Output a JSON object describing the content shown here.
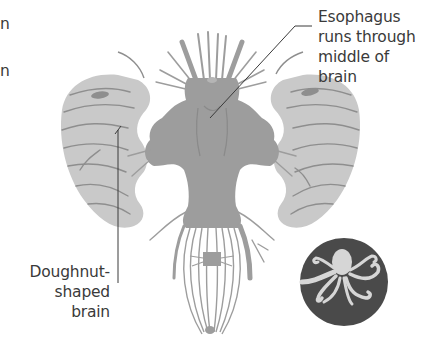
{
  "diagram": {
    "labels": {
      "esophagus": {
        "lines": [
          "Esophagus",
          "runs through",
          "middle of",
          "brain"
        ]
      },
      "doughnut": {
        "lines": [
          "Doughnut-",
          "shaped",
          "brain"
        ]
      }
    },
    "cut_off_text": {
      "line1": "n",
      "line2": "n"
    },
    "icon": "octopus-icon",
    "colors": {
      "brain_lobes": "#c9c9c9",
      "central_mass": "#9d9d9d",
      "nerve_lines": "#8e8e8e",
      "leader_line": "#3a3a3a",
      "icon_circle": "#4a4a4a",
      "icon_figure": "#d6d6d6",
      "text": "#3a3a3a"
    }
  }
}
